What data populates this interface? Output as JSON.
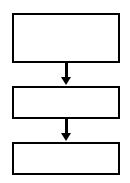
{
  "diagram": {
    "type": "flowchart",
    "nodes": [
      {
        "id": "box-1",
        "label": ""
      },
      {
        "id": "box-2",
        "label": ""
      },
      {
        "id": "box-3",
        "label": ""
      }
    ],
    "edges": [
      {
        "from": "box-1",
        "to": "box-2"
      },
      {
        "from": "box-2",
        "to": "box-3"
      }
    ],
    "colors": {
      "stroke": "#000000",
      "fill": "#ffffff"
    }
  }
}
